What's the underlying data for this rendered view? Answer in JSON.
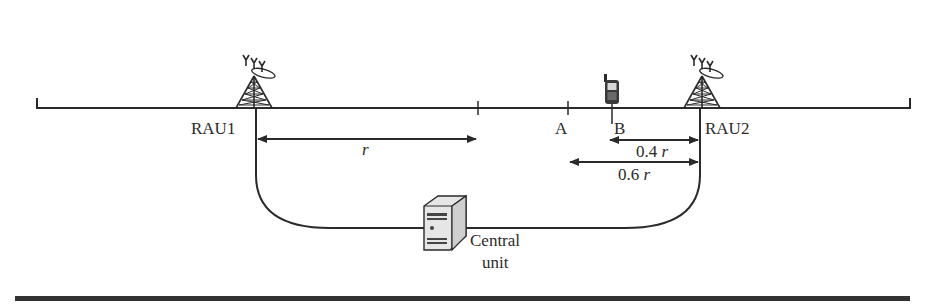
{
  "diagram": {
    "type": "radio-over-fiber layout",
    "nodes": {
      "rau1": {
        "label": "RAU1"
      },
      "rau2": {
        "label": "RAU2"
      },
      "central_unit": {
        "label_line1": "Central",
        "label_line2": "unit"
      },
      "mobile": {
        "icon": "mobile-phone-icon"
      }
    },
    "points": {
      "a": {
        "label": "A"
      },
      "b": {
        "label": "B"
      }
    },
    "distances": {
      "r": {
        "label": "r"
      },
      "d04": {
        "value": "0.4",
        "unit": "r"
      },
      "d06": {
        "value": "0.6",
        "unit": "r"
      }
    },
    "icons": {
      "tower": "antenna-tower-icon",
      "server": "server-icon",
      "phone": "mobile-phone-icon"
    },
    "colors": {
      "line": "#2a2a2a",
      "server_face": "#e8e8e8"
    }
  }
}
